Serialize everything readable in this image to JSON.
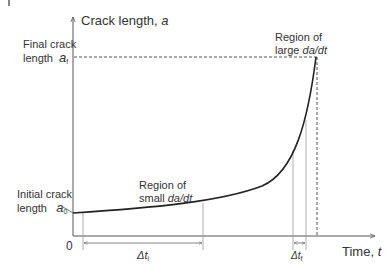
{
  "diagram": {
    "y_axis": {
      "label": "Crack length, ",
      "symbol": "a"
    },
    "x_axis": {
      "label": "Time, ",
      "symbol": "t",
      "origin": "0"
    },
    "final_crack": {
      "line1": "Final crack",
      "line2": "length",
      "symbol": "a",
      "subscript": "f"
    },
    "initial_crack": {
      "line1": "Initial crack",
      "line2": "length",
      "symbol": "a",
      "subscript": "0"
    },
    "region_small": {
      "line1": "Region of",
      "line2_prefix": "small ",
      "line2_rate": "da/dt"
    },
    "region_large": {
      "line1": "Region of",
      "line2_prefix": "large ",
      "line2_rate": "da/dt"
    },
    "delta_ti": {
      "symbol": "Δt",
      "subscript": "i"
    },
    "delta_tf": {
      "symbol": "Δt",
      "subscript": "f"
    },
    "colors": {
      "curve": "#222222",
      "axes": "#555555",
      "guides": "#888888"
    }
  }
}
